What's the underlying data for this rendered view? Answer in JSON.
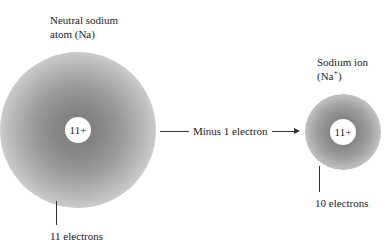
{
  "atom": {
    "title_line1": "Neutral sodium",
    "title_line2": "atom (Na)",
    "nucleus_charge": "11+",
    "electron_label": "11 electrons"
  },
  "ion": {
    "title_line1": "Sodium ion",
    "title_line2_prefix": "(Na",
    "title_line2_sup": "+",
    "title_line2_suffix": ")",
    "nucleus_charge": "11+",
    "electron_label": "10 electrons"
  },
  "arrow": {
    "label": "Minus 1 electron"
  }
}
